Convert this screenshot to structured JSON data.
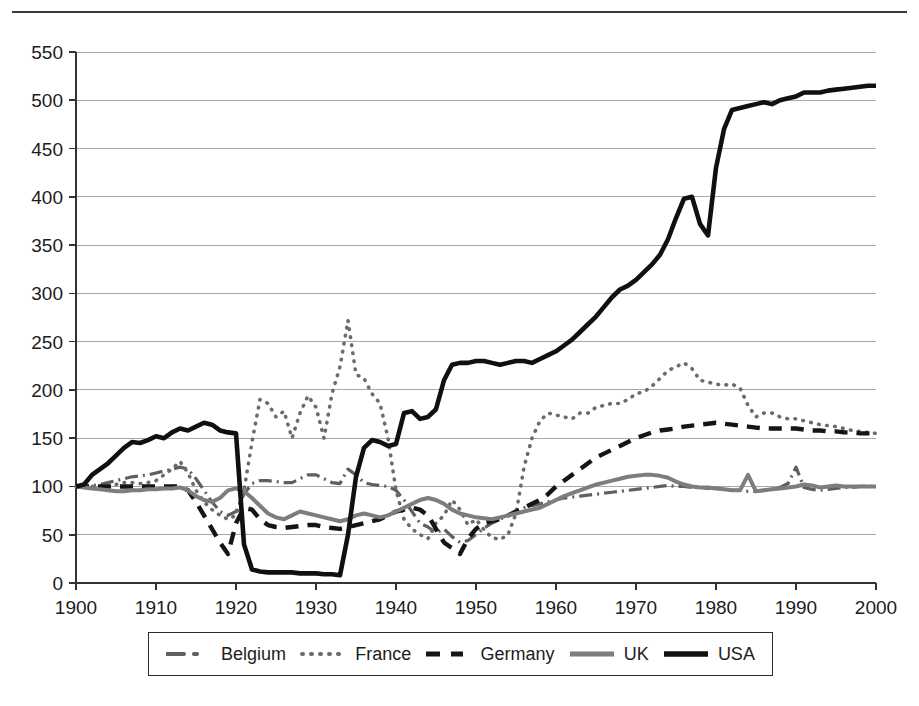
{
  "figure": {
    "has_top_rule": true,
    "background_color": "#ffffff"
  },
  "legend": {
    "position": "bottom",
    "bordered": true,
    "items": [
      {
        "label": "Belgium",
        "style": "dash-dot",
        "color": "#5f5f5f",
        "swatch_name": "legend-swatch-belgium"
      },
      {
        "label": "France",
        "style": "dotted",
        "color": "#6b6b6b",
        "swatch_name": "legend-swatch-france"
      },
      {
        "label": "Germany",
        "style": "dashed",
        "color": "#151515",
        "swatch_name": "legend-swatch-germany"
      },
      {
        "label": "UK",
        "style": "solid",
        "color": "#7d7d7d",
        "swatch_name": "legend-swatch-uk"
      },
      {
        "label": "USA",
        "style": "solid",
        "color": "#101010",
        "swatch_name": "legend-swatch-usa"
      }
    ]
  },
  "chart_data": {
    "type": "line",
    "title": "",
    "subtitle": "",
    "xlabel": "",
    "ylabel": "",
    "xlim": [
      1900,
      2000
    ],
    "ylim": [
      0,
      550
    ],
    "xticks": [
      1900,
      1910,
      1920,
      1930,
      1940,
      1950,
      1960,
      1970,
      1980,
      1990,
      2000
    ],
    "yticks": [
      0,
      50,
      100,
      150,
      200,
      250,
      300,
      350,
      400,
      450,
      500,
      550
    ],
    "xtick_labels": [
      "1900",
      "1910",
      "1920",
      "1930",
      "1940",
      "1950",
      "1960",
      "1970",
      "1980",
      "1990",
      "2000"
    ],
    "ytick_labels": [
      "0",
      "50",
      "100",
      "150",
      "200",
      "250",
      "300",
      "350",
      "400",
      "450",
      "500",
      "550"
    ],
    "grid": {
      "horizontal": true,
      "vertical": false,
      "color": "#a8a8a8"
    },
    "legend_position": "bottom",
    "series": [
      {
        "name": "Belgium",
        "style": "dash-dot",
        "color": "#5f5f5f",
        "x": [
          1900,
          1901,
          1902,
          1903,
          1904,
          1905,
          1906,
          1907,
          1908,
          1909,
          1910,
          1911,
          1912,
          1913,
          1914,
          1915,
          1916,
          1917,
          1918,
          1919,
          1920,
          1921,
          1922,
          1923,
          1924,
          1925,
          1926,
          1927,
          1928,
          1929,
          1930,
          1931,
          1932,
          1933,
          1934,
          1935,
          1936,
          1937,
          1938,
          1939,
          1940,
          1941,
          1942,
          1943,
          1944,
          1945,
          1946,
          1947,
          1948,
          1949,
          1950,
          1951,
          1952,
          1953,
          1954,
          1955,
          1956,
          1957,
          1958,
          1959,
          1960,
          1961,
          1962,
          1963,
          1964,
          1965,
          1966,
          1967,
          1968,
          1969,
          1970,
          1971,
          1972,
          1973,
          1974,
          1975,
          1976,
          1977,
          1978,
          1979,
          1980,
          1981,
          1982,
          1983,
          1984,
          1985,
          1986,
          1987,
          1988,
          1989,
          1990,
          1991,
          1992,
          1993,
          1994,
          1995,
          1996,
          1997,
          1998,
          1999,
          2000
        ],
        "values": [
          100,
          100,
          101,
          102,
          104,
          106,
          108,
          110,
          111,
          112,
          114,
          116,
          118,
          120,
          118,
          108,
          96,
          84,
          74,
          70,
          74,
          92,
          103,
          106,
          106,
          105,
          104,
          104,
          108,
          112,
          112,
          108,
          104,
          103,
          118,
          112,
          104,
          102,
          101,
          100,
          96,
          86,
          74,
          62,
          58,
          52,
          56,
          48,
          42,
          44,
          50,
          57,
          62,
          66,
          70,
          74,
          78,
          80,
          82,
          84,
          86,
          88,
          89,
          90,
          91,
          92,
          93,
          94,
          95,
          96,
          97,
          98,
          99,
          100,
          101,
          100,
          100,
          99,
          99,
          98,
          98,
          97,
          96,
          96,
          95,
          95,
          96,
          97,
          99,
          103,
          120,
          99,
          97,
          96,
          97,
          98,
          99,
          99,
          100,
          100,
          100
        ]
      },
      {
        "name": "France",
        "style": "dotted",
        "color": "#6b6b6b",
        "x": [
          1900,
          1901,
          1902,
          1903,
          1904,
          1905,
          1906,
          1907,
          1908,
          1909,
          1910,
          1911,
          1912,
          1913,
          1914,
          1915,
          1916,
          1917,
          1918,
          1919,
          1920,
          1921,
          1922,
          1923,
          1924,
          1925,
          1926,
          1927,
          1928,
          1929,
          1930,
          1931,
          1932,
          1933,
          1934,
          1935,
          1936,
          1937,
          1938,
          1939,
          1940,
          1941,
          1942,
          1943,
          1944,
          1945,
          1946,
          1947,
          1948,
          1949,
          1950,
          1951,
          1952,
          1953,
          1954,
          1955,
          1956,
          1957,
          1958,
          1959,
          1960,
          1961,
          1962,
          1963,
          1964,
          1965,
          1966,
          1967,
          1968,
          1969,
          1970,
          1971,
          1972,
          1973,
          1974,
          1975,
          1976,
          1977,
          1978,
          1979,
          1980,
          1981,
          1982,
          1983,
          1984,
          1985,
          1986,
          1987,
          1988,
          1989,
          1990,
          1991,
          1992,
          1993,
          1994,
          1995,
          1996,
          1997,
          1998,
          1999,
          2000
        ],
        "values": [
          100,
          100,
          100,
          99,
          100,
          102,
          104,
          104,
          103,
          104,
          106,
          112,
          118,
          126,
          114,
          96,
          84,
          76,
          70,
          66,
          70,
          96,
          146,
          190,
          186,
          172,
          178,
          150,
          176,
          194,
          182,
          150,
          196,
          224,
          272,
          216,
          212,
          196,
          186,
          150,
          96,
          66,
          56,
          50,
          46,
          62,
          70,
          86,
          76,
          60,
          66,
          55,
          47,
          45,
          50,
          72,
          120,
          150,
          168,
          176,
          174,
          172,
          170,
          176,
          176,
          182,
          184,
          186,
          186,
          190,
          196,
          198,
          204,
          212,
          220,
          224,
          228,
          222,
          210,
          208,
          206,
          205,
          206,
          202,
          184,
          172,
          176,
          176,
          172,
          170,
          170,
          168,
          166,
          164,
          163,
          162,
          160,
          158,
          157,
          156,
          155
        ]
      },
      {
        "name": "Germany",
        "style": "dashed",
        "color": "#151515",
        "x": [
          1900,
          1901,
          1902,
          1903,
          1904,
          1905,
          1906,
          1907,
          1908,
          1909,
          1910,
          1911,
          1912,
          1913,
          1914,
          1915,
          1916,
          1917,
          1918,
          1919,
          1920,
          1921,
          1922,
          1923,
          1924,
          1925,
          1926,
          1927,
          1928,
          1929,
          1930,
          1931,
          1932,
          1933,
          1934,
          1935,
          1936,
          1937,
          1938,
          1939,
          1940,
          1941,
          1942,
          1943,
          1944,
          1945,
          1946,
          1947,
          1948,
          1949,
          1950,
          1951,
          1952,
          1953,
          1954,
          1955,
          1956,
          1957,
          1958,
          1959,
          1960,
          1961,
          1962,
          1963,
          1964,
          1965,
          1966,
          1967,
          1968,
          1969,
          1970,
          1971,
          1972,
          1973,
          1974,
          1975,
          1976,
          1977,
          1978,
          1979,
          1980,
          1981,
          1982,
          1983,
          1984,
          1985,
          1986,
          1987,
          1988,
          1989,
          1990,
          1991,
          1992,
          1993,
          1994,
          1995,
          1996,
          1997,
          1998,
          1999,
          2000
        ],
        "values": [
          100,
          100,
          100,
          100,
          100,
          100,
          100,
          100,
          100,
          100,
          100,
          100,
          100,
          100,
          96,
          84,
          70,
          56,
          42,
          30,
          62,
          78,
          76,
          66,
          60,
          58,
          57,
          58,
          59,
          60,
          60,
          58,
          57,
          56,
          58,
          60,
          62,
          64,
          66,
          70,
          74,
          76,
          78,
          76,
          70,
          56,
          42,
          36,
          30,
          46,
          56,
          62,
          64,
          66,
          70,
          74,
          78,
          82,
          86,
          92,
          100,
          106,
          112,
          118,
          124,
          130,
          134,
          138,
          142,
          146,
          150,
          153,
          156,
          158,
          159,
          160,
          162,
          163,
          164,
          165,
          166,
          165,
          164,
          163,
          162,
          161,
          160,
          160,
          160,
          160,
          160,
          159,
          158,
          158,
          157,
          157,
          156,
          156,
          155,
          155,
          155
        ]
      },
      {
        "name": "UK",
        "style": "solid",
        "color": "#7d7d7d",
        "x": [
          1900,
          1901,
          1902,
          1903,
          1904,
          1905,
          1906,
          1907,
          1908,
          1909,
          1910,
          1911,
          1912,
          1913,
          1914,
          1915,
          1916,
          1917,
          1918,
          1919,
          1920,
          1921,
          1922,
          1923,
          1924,
          1925,
          1926,
          1927,
          1928,
          1929,
          1930,
          1931,
          1932,
          1933,
          1934,
          1935,
          1936,
          1937,
          1938,
          1939,
          1940,
          1941,
          1942,
          1943,
          1944,
          1945,
          1946,
          1947,
          1948,
          1949,
          1950,
          1951,
          1952,
          1953,
          1954,
          1955,
          1956,
          1957,
          1958,
          1959,
          1960,
          1961,
          1962,
          1963,
          1964,
          1965,
          1966,
          1967,
          1968,
          1969,
          1970,
          1971,
          1972,
          1973,
          1974,
          1975,
          1976,
          1977,
          1978,
          1979,
          1980,
          1981,
          1982,
          1983,
          1984,
          1985,
          1986,
          1987,
          1988,
          1989,
          1990,
          1991,
          1992,
          1993,
          1994,
          1995,
          1996,
          1997,
          1998,
          1999,
          2000
        ],
        "values": [
          100,
          99,
          98,
          97,
          96,
          95,
          95,
          96,
          96,
          97,
          97,
          98,
          98,
          99,
          96,
          90,
          86,
          84,
          88,
          96,
          98,
          95,
          88,
          80,
          72,
          68,
          66,
          70,
          74,
          72,
          70,
          68,
          66,
          64,
          66,
          70,
          72,
          70,
          68,
          70,
          74,
          78,
          82,
          86,
          88,
          86,
          82,
          76,
          72,
          70,
          68,
          67,
          66,
          68,
          70,
          72,
          74,
          76,
          78,
          82,
          86,
          90,
          93,
          96,
          99,
          102,
          104,
          106,
          108,
          110,
          111,
          112,
          112,
          111,
          109,
          105,
          102,
          100,
          99,
          99,
          98,
          97,
          96,
          96,
          112,
          95,
          96,
          97,
          98,
          99,
          100,
          102,
          101,
          99,
          100,
          101,
          100,
          100,
          100,
          100,
          100
        ]
      },
      {
        "name": "USA",
        "style": "solid",
        "color": "#101010",
        "x": [
          1900,
          1901,
          1902,
          1903,
          1904,
          1905,
          1906,
          1907,
          1908,
          1909,
          1910,
          1911,
          1912,
          1913,
          1914,
          1915,
          1916,
          1917,
          1918,
          1919,
          1920,
          1921,
          1922,
          1923,
          1924,
          1925,
          1926,
          1927,
          1928,
          1929,
          1930,
          1931,
          1932,
          1933,
          1934,
          1935,
          1936,
          1937,
          1938,
          1939,
          1940,
          1941,
          1942,
          1943,
          1944,
          1945,
          1946,
          1947,
          1948,
          1949,
          1950,
          1951,
          1952,
          1953,
          1954,
          1955,
          1956,
          1957,
          1958,
          1959,
          1960,
          1961,
          1962,
          1963,
          1964,
          1965,
          1966,
          1967,
          1968,
          1969,
          1970,
          1971,
          1972,
          1973,
          1974,
          1975,
          1976,
          1977,
          1978,
          1979,
          1980,
          1981,
          1982,
          1983,
          1984,
          1985,
          1986,
          1987,
          1988,
          1989,
          1990,
          1991,
          1992,
          1993,
          1994,
          1995,
          1996,
          1997,
          1998,
          1999,
          2000
        ],
        "values": [
          100,
          102,
          112,
          118,
          124,
          132,
          140,
          146,
          145,
          148,
          152,
          150,
          156,
          160,
          158,
          162,
          166,
          164,
          158,
          156,
          155,
          40,
          14,
          12,
          11,
          11,
          11,
          11,
          10,
          10,
          10,
          9,
          9,
          8,
          50,
          110,
          140,
          148,
          146,
          142,
          144,
          176,
          178,
          170,
          172,
          180,
          210,
          226,
          228,
          228,
          230,
          230,
          228,
          226,
          228,
          230,
          230,
          228,
          232,
          236,
          240,
          246,
          252,
          260,
          268,
          276,
          286,
          296,
          304,
          308,
          314,
          322,
          330,
          340,
          356,
          378,
          398,
          400,
          372,
          360,
          430,
          470,
          490,
          492,
          494,
          496,
          498,
          496,
          500,
          502,
          504,
          508,
          508,
          508,
          510,
          511,
          512,
          513,
          514,
          515,
          515
        ]
      }
    ]
  }
}
